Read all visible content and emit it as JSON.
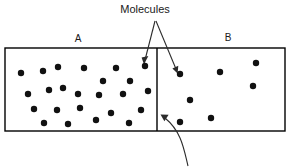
{
  "diagram": {
    "title_label": "Molecules",
    "chambers": [
      {
        "id": "A",
        "label": "A",
        "label_x": 78,
        "label_y": 42
      },
      {
        "id": "B",
        "label": "B",
        "label_x": 228,
        "label_y": 41
      }
    ],
    "container": {
      "x": 5,
      "y": 48,
      "width": 280,
      "height": 83,
      "divider_x": 157,
      "stroke_color": "#000000"
    },
    "molecule_color": "#111111",
    "molecule_radius": 3.2,
    "molecules_a": [
      {
        "x": 21,
        "y": 73
      },
      {
        "x": 43,
        "y": 71
      },
      {
        "x": 58,
        "y": 67
      },
      {
        "x": 84,
        "y": 68
      },
      {
        "x": 116,
        "y": 68
      },
      {
        "x": 145,
        "y": 66
      },
      {
        "x": 103,
        "y": 81
      },
      {
        "x": 130,
        "y": 81
      },
      {
        "x": 49,
        "y": 90
      },
      {
        "x": 63,
        "y": 88
      },
      {
        "x": 28,
        "y": 94
      },
      {
        "x": 78,
        "y": 94
      },
      {
        "x": 99,
        "y": 95
      },
      {
        "x": 123,
        "y": 94
      },
      {
        "x": 148,
        "y": 91
      },
      {
        "x": 34,
        "y": 109
      },
      {
        "x": 57,
        "y": 110
      },
      {
        "x": 80,
        "y": 108
      },
      {
        "x": 111,
        "y": 113
      },
      {
        "x": 141,
        "y": 110
      },
      {
        "x": 44,
        "y": 123
      },
      {
        "x": 68,
        "y": 124
      },
      {
        "x": 96,
        "y": 120
      },
      {
        "x": 129,
        "y": 123
      }
    ],
    "molecules_b": [
      {
        "x": 180,
        "y": 122
      },
      {
        "x": 180,
        "y": 74
      },
      {
        "x": 190,
        "y": 100
      },
      {
        "x": 211,
        "y": 118
      },
      {
        "x": 220,
        "y": 72
      },
      {
        "x": 256,
        "y": 63
      },
      {
        "x": 253,
        "y": 86
      }
    ],
    "annotations": {
      "title_x": 145,
      "title_y": 13,
      "apex_x": 155,
      "apex_y": 20,
      "arrow_left_tip_x": 144,
      "arrow_left_tip_y": 62,
      "arrow_right_tip_x": 177,
      "arrow_right_tip_y": 72,
      "curve_arrow_tip_x": 161,
      "curve_arrow_tip_y": 115,
      "curve_arrow_start_x": 188,
      "curve_arrow_start_y": 165
    }
  }
}
